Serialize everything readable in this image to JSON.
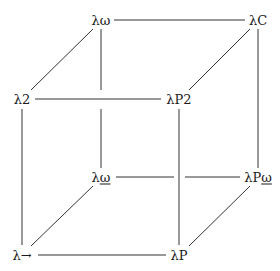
{
  "diagram": {
    "nodes": [
      {
        "id": "lw",
        "prefix": "λ",
        "suffix": "ω",
        "underline": false,
        "x": 101,
        "y": 20
      },
      {
        "id": "lC",
        "prefix": "λC",
        "suffix": "",
        "underline": false,
        "x": 258,
        "y": 20
      },
      {
        "id": "l2",
        "prefix": "λ2",
        "suffix": "",
        "underline": false,
        "x": 22,
        "y": 99
      },
      {
        "id": "lP2",
        "prefix": "λP2",
        "suffix": "",
        "underline": false,
        "x": 179,
        "y": 99
      },
      {
        "id": "lwu",
        "prefix": "λ",
        "suffix": "ω",
        "underline": true,
        "x": 101,
        "y": 177
      },
      {
        "id": "lPwu",
        "prefix": "λP",
        "suffix": "ω",
        "underline": true,
        "x": 258,
        "y": 177
      },
      {
        "id": "lto",
        "prefix": "λ→",
        "suffix": "",
        "underline": false,
        "x": 22,
        "y": 255
      },
      {
        "id": "lP",
        "prefix": "λP",
        "suffix": "",
        "underline": false,
        "x": 179,
        "y": 255
      }
    ],
    "edges": [
      {
        "from": "lw",
        "to": "lC"
      },
      {
        "from": "l2",
        "to": "lP2"
      },
      {
        "from": "lwu",
        "to": "lPwu"
      },
      {
        "from": "lto",
        "to": "lP"
      },
      {
        "from": "lw",
        "to": "l2"
      },
      {
        "from": "lC",
        "to": "lP2"
      },
      {
        "from": "lwu",
        "to": "lto"
      },
      {
        "from": "lPwu",
        "to": "lP"
      },
      {
        "from": "lw",
        "to": "lwu"
      },
      {
        "from": "lC",
        "to": "lPwu"
      },
      {
        "from": "l2",
        "to": "lto"
      },
      {
        "from": "lP2",
        "to": "lP"
      }
    ],
    "stroke_color": "#333333",
    "text_color": "#1a1a1a"
  }
}
